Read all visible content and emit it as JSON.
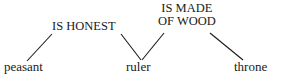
{
  "diagram": {
    "type": "semantic-network",
    "width": 284,
    "height": 78,
    "background_color": "#ffffff",
    "ink_color": "#1a1a1a",
    "nodes": [
      {
        "id": "peasant",
        "label": "peasant"
      },
      {
        "id": "ruler",
        "label": "ruler"
      },
      {
        "id": "throne",
        "label": "throne"
      }
    ],
    "relations": [
      {
        "id": "is-honest",
        "lines": [
          "IS HONEST"
        ],
        "text": "IS HONEST",
        "connects": [
          "peasant",
          "ruler"
        ]
      },
      {
        "id": "is-made-of-wood",
        "lines": [
          "IS MADE",
          "OF WOOD"
        ],
        "text": "IS MADE OF WOOD",
        "connects": [
          "ruler",
          "throne"
        ]
      }
    ],
    "edges": [
      {
        "id": "edge-peasant-to-is-honest",
        "from": "peasant",
        "to": "is-honest",
        "x1": 27,
        "y1": 61,
        "x2": 52,
        "y2": 34
      },
      {
        "id": "edge-is-honest-to-ruler",
        "from": "is-honest",
        "to": "ruler",
        "x1": 121,
        "y1": 34,
        "x2": 141,
        "y2": 60
      },
      {
        "id": "edge-ruler-to-is-made-of-wood",
        "from": "ruler",
        "to": "is-made-of-wood",
        "x1": 142,
        "y1": 60,
        "x2": 164,
        "y2": 33
      },
      {
        "id": "edge-is-made-of-wood-to-throne",
        "from": "is-made-of-wood",
        "to": "throne",
        "x1": 210,
        "y1": 33,
        "x2": 243,
        "y2": 60
      }
    ]
  }
}
